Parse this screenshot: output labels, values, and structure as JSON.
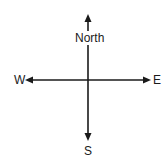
{
  "diagram": {
    "type": "compass",
    "labels": {
      "north": "North",
      "south": "S",
      "east": "E",
      "west": "W"
    },
    "color": "#1a1a1a"
  }
}
